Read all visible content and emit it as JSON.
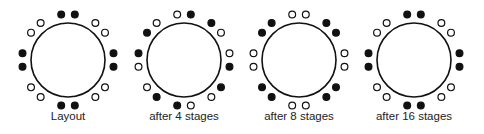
{
  "diagram": {
    "colors": {
      "stroke": "#111111",
      "filled": "#111111",
      "open": "#ffffff",
      "text": "#222222"
    },
    "ring_radius": 37,
    "dot_radius": 3.4,
    "dot_offset": 9,
    "pair_spread_deg": 8.5,
    "positions_clockwise": [
      "N",
      "NE",
      "E",
      "SE",
      "S",
      "SW",
      "W",
      "NW"
    ],
    "panels": [
      {
        "label": "Layout",
        "center": [
          68,
          60
        ],
        "pairs": [
          [
            "filled",
            "filled"
          ],
          [
            "open",
            "open"
          ],
          [
            "filled",
            "filled"
          ],
          [
            "open",
            "open"
          ],
          [
            "filled",
            "filled"
          ],
          [
            "open",
            "open"
          ],
          [
            "filled",
            "filled"
          ],
          [
            "open",
            "open"
          ]
        ]
      },
      {
        "label": "after 4 stages",
        "center": [
          184,
          60
        ],
        "pairs": [
          [
            "open",
            "filled"
          ],
          [
            "filled",
            "open"
          ],
          [
            "open",
            "filled"
          ],
          [
            "filled",
            "open"
          ],
          [
            "open",
            "filled"
          ],
          [
            "filled",
            "open"
          ],
          [
            "open",
            "filled"
          ],
          [
            "filled",
            "open"
          ]
        ]
      },
      {
        "label": "after 8 stages",
        "center": [
          299,
          60
        ],
        "pairs": [
          [
            "open",
            "open"
          ],
          [
            "filled",
            "filled"
          ],
          [
            "open",
            "open"
          ],
          [
            "filled",
            "filled"
          ],
          [
            "open",
            "open"
          ],
          [
            "filled",
            "filled"
          ],
          [
            "open",
            "open"
          ],
          [
            "filled",
            "filled"
          ]
        ]
      },
      {
        "label": "after 16 stages",
        "center": [
          414,
          60
        ],
        "pairs": [
          [
            "filled",
            "filled"
          ],
          [
            "open",
            "open"
          ],
          [
            "filled",
            "filled"
          ],
          [
            "open",
            "open"
          ],
          [
            "filled",
            "filled"
          ],
          [
            "open",
            "open"
          ],
          [
            "filled",
            "filled"
          ],
          [
            "open",
            "open"
          ]
        ]
      }
    ]
  }
}
